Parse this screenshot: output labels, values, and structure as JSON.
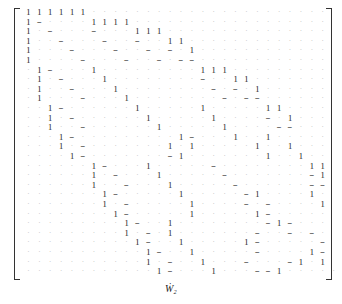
{
  "caption": "Ẇ₂",
  "symbols": {
    "1": "1",
    "-": "−",
    ".": "·"
  },
  "matrix_rows": [
    "111111......................",
    "1-....1111..................",
    "1.-...-...111...............",
    "1..-...-..-..11.............",
    "1...-...-..-.-.1............",
    "1....-...-..-.--............",
    ".1-...1.........111.........",
    ".1.-...1........-..11.......",
    ".1..-...1........-.-.1......",
    ".1...-...1........-.--......",
    "..1-......1.....1.....11....",
    "..1.-......1.....1....-.1...",
    "..1..-......1.....1....--...",
    "...1-.........1-...1..1.....",
    "...1.-.......1.1.....1..1...",
    "....1-.......-1.......1..1..",
    "......1-...1.....-........11",
    "......1.-...1.....-.......-1",
    "......1..-...1.....-......--",
    ".......1-.....1.....-1....1.",
    ".......1.-.....1....-.-....1",
    "........1-.....1.....1-.....",
    ".........1-..1........-1-...",
    ".........1.-.1.......-..-.-.",
    "..........1-..1.....1-.....-",
    "...........1-..1.....-....1-",
    "...........1.-..1...-...-1.1",
    "............1-...1...--1....."
  ]
}
